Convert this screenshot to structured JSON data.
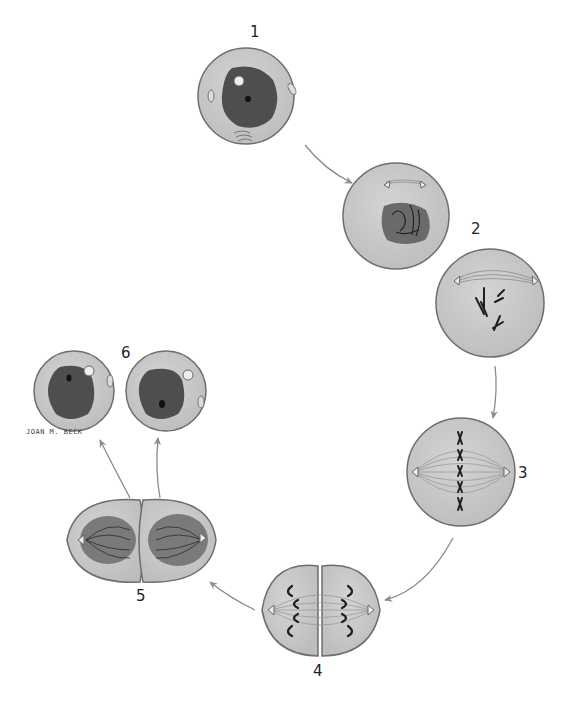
{
  "credit": "JOAN M. BECK",
  "colors": {
    "cytoplasm": "#c9c9c9",
    "cell_outline": "#6e6e6e",
    "nucleus": "#4e4e4e",
    "chromosome": "#1e1e1e",
    "arrow": "#8a8a8a",
    "spindle": "#9a9a9a"
  },
  "stages": [
    {
      "number": "1",
      "name": "interphase"
    },
    {
      "number": "2",
      "name": "prophase"
    },
    {
      "number": "3",
      "name": "metaphase"
    },
    {
      "number": "4",
      "name": "anaphase"
    },
    {
      "number": "5",
      "name": "telophase"
    },
    {
      "number": "6",
      "name": "daughter cells"
    }
  ]
}
